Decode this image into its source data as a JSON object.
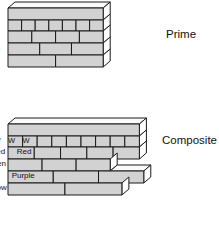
{
  "figure": {
    "background_color": "#ffffff",
    "rod_face_color": "#d2d2d2",
    "rod_top_color": "#fbfbfb",
    "rod_side_color": "#ffffff",
    "rod_outline_color": "#1a1a1a",
    "text_color": "#111111"
  },
  "groups": [
    {
      "caption": "Prime",
      "caption_x": 166,
      "caption_y": 29,
      "origin_x": 8,
      "origin_y": 8,
      "unit_width": 13.6,
      "rows": [
        {
          "name": "black-row",
          "segments": [
            {
              "label": "Black",
              "units": 7
            }
          ],
          "label_font_size": 8.5,
          "row_height": 12
        },
        {
          "name": "white-row",
          "segments": [
            {
              "label": "W",
              "units": 1
            },
            {
              "label": "W",
              "units": 1
            },
            {
              "label": "W",
              "units": 1
            },
            {
              "label": "W",
              "units": 1
            },
            {
              "label": "W",
              "units": 1
            },
            {
              "label": "W",
              "units": 1
            },
            {
              "label": "W",
              "units": 1
            }
          ],
          "label_font_size": 7.5,
          "row_height": 11
        },
        {
          "name": "red-row",
          "segments": [
            {
              "label": "Red",
              "units": 1.75
            },
            {
              "label": "Red",
              "units": 1.75
            },
            {
              "label": "Red",
              "units": 1.75
            },
            {
              "label": "Red",
              "units": 1.75
            }
          ],
          "label_font_size": 8,
          "row_height": 12
        },
        {
          "name": "green-row",
          "segments": [
            {
              "label": "Green",
              "units": 2.3333
            },
            {
              "label": "Green",
              "units": 2.3333
            },
            {
              "label": "Green",
              "units": 2.3333
            }
          ],
          "label_font_size": 8,
          "row_height": 12
        },
        {
          "name": "purple-row",
          "segments": [
            {
              "label": "Purple",
              "units": 3.5
            },
            {
              "label": "Purple",
              "units": 3.5
            }
          ],
          "label_font_size": 8,
          "row_height": 12
        }
      ]
    },
    {
      "caption": "Composite",
      "caption_x": 162,
      "caption_y": 135,
      "origin_x": 8,
      "origin_y": 124,
      "unit_width": 14.6,
      "rows": [
        {
          "name": "blue-row",
          "segments": [
            {
              "label": "Blue",
              "units": 9
            }
          ],
          "label_font_size": 8.5,
          "row_height": 12
        },
        {
          "name": "white-row",
          "segments": [
            {
              "label": "W",
              "units": 1
            },
            {
              "label": "W",
              "units": 1
            },
            {
              "label": "W",
              "units": 1
            },
            {
              "label": "W",
              "units": 1
            },
            {
              "label": "W",
              "units": 1
            },
            {
              "label": "W",
              "units": 1
            },
            {
              "label": "W",
              "units": 1
            },
            {
              "label": "W",
              "units": 1
            },
            {
              "label": "W",
              "units": 1
            }
          ],
          "label_font_size": 7.5,
          "row_height": 11
        },
        {
          "name": "red-row",
          "segments": [
            {
              "label": "Red",
              "units": 1.8
            },
            {
              "label": "Red",
              "units": 1.8
            },
            {
              "label": "Red",
              "units": 1.8
            },
            {
              "label": "Red",
              "units": 1.8
            },
            {
              "label": "Red",
              "units": 1.8
            }
          ],
          "label_font_size": 8,
          "row_height": 12
        },
        {
          "name": "green-row",
          "segments": [
            {
              "label": "Green",
              "units": 2.3333
            },
            {
              "label": "Green",
              "units": 2.3333
            },
            {
              "label": "Green",
              "units": 2.3333
            }
          ],
          "label_font_size": 8,
          "row_height": 12
        },
        {
          "name": "purple-row",
          "segments": [
            {
              "label": "Purple",
              "units": 3.1
            },
            {
              "label": "Purple",
              "units": 3.1
            },
            {
              "label": "Purple",
              "units": 3.1
            }
          ],
          "label_font_size": 8,
          "row_height": 12
        },
        {
          "name": "yellow-row",
          "segments": [
            {
              "label": "Yellow",
              "units": 3.9
            },
            {
              "label": "Yellow",
              "units": 3.9
            }
          ],
          "label_font_size": 8,
          "row_height": 12
        }
      ]
    }
  ]
}
